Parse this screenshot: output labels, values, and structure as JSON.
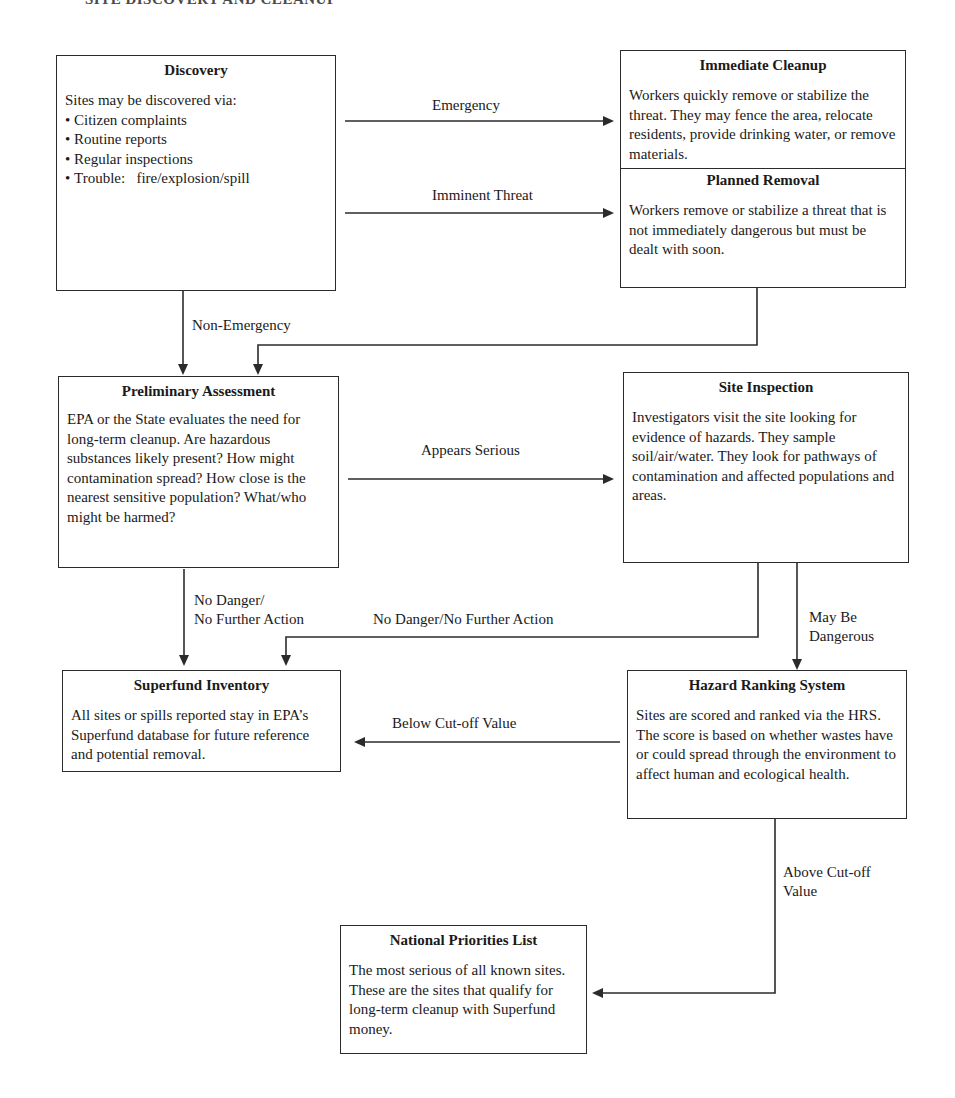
{
  "header": {
    "title": "SITE DISCOVERY AND CLEANUP"
  },
  "boxes": {
    "discovery": {
      "title": "Discovery",
      "intro": "Sites may be discovered via:",
      "bullets": [
        "Citizen complaints",
        "Routine reports",
        "Regular inspections",
        "Trouble:   fire/explosion/spill"
      ]
    },
    "immediate_cleanup": {
      "title": "Immediate Cleanup",
      "body": "Workers quickly remove or stabilize the threat. They may fence the area, relocate residents, provide drinking water, or remove materials."
    },
    "planned_removal": {
      "title": "Planned Removal",
      "body": "Workers remove or stabilize a threat that is not immediately dangerous but must be dealt with soon."
    },
    "preliminary_assessment": {
      "title": "Preliminary Assessment",
      "body": "EPA or the State evaluates the need for long-term cleanup. Are hazardous substances likely present? How might contamination spread? How close is the nearest sensitive population? What/who might be harmed?"
    },
    "site_inspection": {
      "title": "Site Inspection",
      "body": "Investigators visit the site looking for evidence of hazards. They sample soil/air/water. They look for pathways of contamination and affected populations and areas."
    },
    "superfund_inventory": {
      "title": "Superfund Inventory",
      "body": "All sites or spills reported stay in EPA’s Superfund database for future reference and potential removal."
    },
    "hazard_ranking_system": {
      "title": "Hazard Ranking System",
      "body": "Sites are scored and ranked via the HRS. The score is based on whether wastes have or could spread through the environment to affect human and ecological health."
    },
    "national_priorities_list": {
      "title": "National Priorities List",
      "body": "The most serious of all known sites. These are the sites that qualify for long-term cleanup with Superfund money."
    }
  },
  "edges": {
    "emergency": "Emergency",
    "imminent_threat": "Imminent Threat",
    "non_emergency": "Non-Emergency",
    "appears_serious": "Appears Serious",
    "no_danger_left_line1": "No Danger/",
    "no_danger_left_line2": "No Further Action",
    "no_danger_right": "No Danger/No Further Action",
    "may_be_line1": "May Be",
    "may_be_line2": "Dangerous",
    "below_cutoff": "Below Cut-off Value",
    "above_cutoff_line1": "Above Cut-off",
    "above_cutoff_line2": "Value"
  }
}
